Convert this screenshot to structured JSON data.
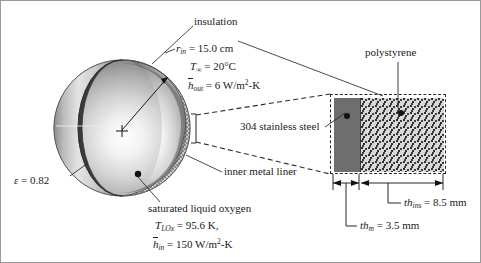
{
  "figure": {
    "labels": {
      "insulation": "insulation",
      "polystyrene": "polystyrene",
      "stainless_steel": "304 stainless steel",
      "inner_metal_liner": "inner metal liner",
      "saturated_liquid_oxygen": "saturated liquid oxygen"
    },
    "annotations": {
      "radius": {
        "symbol": "r",
        "subscript": "in",
        "eq": "=",
        "value": "15.0 cm"
      },
      "ambient_temp": {
        "symbol": "T",
        "subscript": "∞",
        "eq": "=",
        "value": "20°C"
      },
      "h_outer": {
        "symbol": "h",
        "subscript": "out",
        "eq": "=",
        "value": "6 W/m",
        "exp": "2",
        "tail": "-K"
      },
      "emissivity": {
        "symbol": "ε",
        "eq": "=",
        "value": "0.82"
      },
      "lox_temp": {
        "symbol": "T",
        "subscript": "LOx",
        "eq": "=",
        "value": "95.6 K,"
      },
      "h_inner": {
        "symbol": "h",
        "subscript": "in",
        "eq": "=",
        "value": "150 W/m",
        "exp": "2",
        "tail": "-K"
      },
      "th_ins": {
        "symbol": "th",
        "subscript": "ins",
        "eq": "=",
        "value": "8.5 mm"
      },
      "th_m": {
        "symbol": "th",
        "subscript": "m",
        "eq": "=",
        "value": "3.5 mm"
      }
    },
    "colors": {
      "sphere_light": "#f4f4f4",
      "sphere_mid": "#b9b9b9",
      "sphere_dark": "#7c7c7c",
      "metal_layer": "#6e6e6e",
      "insulation_layer": "#d8d8d8",
      "line": "#1a1a1a",
      "dashed": "#2a2a2a",
      "frame": "#9a9a9a"
    },
    "geometry": {
      "sphere_center_x": 122,
      "sphere_center_y": 128,
      "sphere_radius": 68,
      "detail_box": {
        "x": 330,
        "y": 94,
        "w": 116,
        "h": 80
      },
      "metal_width_px": 26,
      "insulation_width_px": 86
    }
  }
}
